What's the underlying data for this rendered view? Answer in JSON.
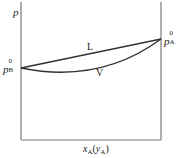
{
  "diagram": {
    "title": "",
    "y_axis_label": "p",
    "x_axis_label": {
      "main": "x",
      "main_sub": "A",
      "paren_var": "y",
      "paren_sub": "A"
    },
    "left_label": {
      "base": "p",
      "sup": "0",
      "sub": "B"
    },
    "right_label": {
      "base": "p",
      "sup": "0",
      "sub": "A"
    },
    "curves": [
      {
        "name": "L",
        "label": "L",
        "shape": "straight line from p_B^0 to p_A^0"
      },
      {
        "name": "V",
        "label": "V",
        "shape": "convex curve below L from p_B^0 to p_A^0"
      }
    ],
    "colors": {
      "axis": "#7a7a7a",
      "curve": "#333333",
      "text": "#222222",
      "background": "#ffffff"
    }
  }
}
